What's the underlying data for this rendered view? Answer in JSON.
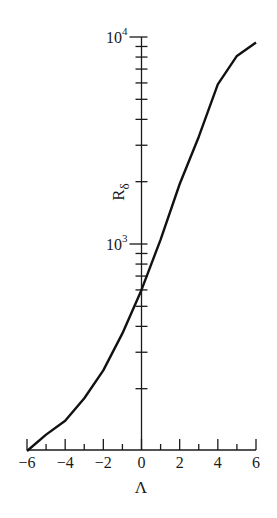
{
  "chart_data": {
    "type": "line",
    "title": "",
    "xlabel": "Λ",
    "ylabel": "R",
    "ylabel_subscript": "δ",
    "yscale": "log",
    "xlim": [
      -6,
      6
    ],
    "ylim": [
      100,
      10000
    ],
    "grid": false,
    "x_ticks": [
      -6,
      -4,
      -2,
      0,
      2,
      4,
      6
    ],
    "x_tick_labels": [
      "−6",
      "−4",
      "−2",
      "0",
      "2",
      "4",
      "6"
    ],
    "x_minor_ticks": [
      -5,
      -3,
      -1,
      1,
      3,
      5
    ],
    "y_major_ticks": [
      1000,
      10000
    ],
    "y_tick_labels": [
      {
        "base": "10",
        "exp": "3"
      },
      {
        "base": "10",
        "exp": "4"
      }
    ],
    "y_minor_ticks": [
      200,
      300,
      400,
      500,
      600,
      700,
      800,
      900,
      2000,
      3000,
      4000,
      5000,
      6000,
      7000,
      8000,
      9000
    ],
    "series": [
      {
        "name": "R_δ vs Λ",
        "x": [
          -6,
          -5,
          -4,
          -3,
          -2,
          -1,
          0,
          1,
          2,
          3,
          4,
          5,
          6
        ],
        "y": [
          100,
          120,
          140,
          180,
          245,
          370,
          600,
          1050,
          1950,
          3300,
          5900,
          8100,
          9400
        ]
      }
    ]
  }
}
